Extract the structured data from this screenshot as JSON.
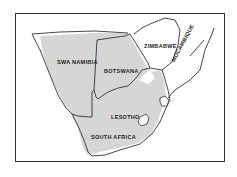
{
  "map": {
    "colors": {
      "shading": "#d6d6d6",
      "border": "#333333",
      "frame": "#333333",
      "background": "#ffffff"
    },
    "labels": {
      "swa_namibia": "SWA NAMIBIA",
      "botswana": "BOTSWANA",
      "zimbabwe": "ZIMBABWE",
      "mocambique": "MOCAMBIQUE",
      "lesotho": "LESOTHO",
      "south_africa": "SOUTH AFRICA"
    }
  }
}
